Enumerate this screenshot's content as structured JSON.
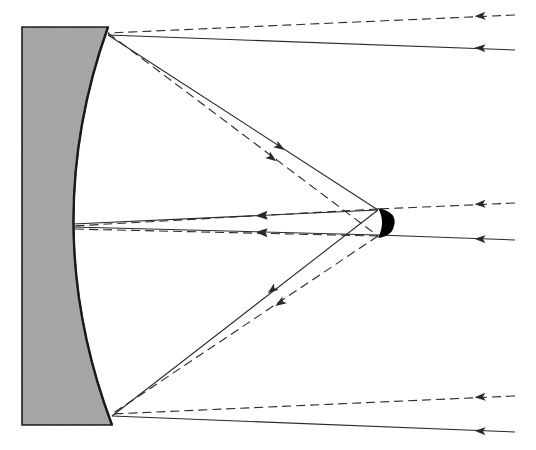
{
  "diagram": {
    "colors": {
      "mirror_fill": "#a9a9a9",
      "mirror_edge": "#1a1a1a",
      "ray": "#2a2a2a",
      "secondary": "#000000",
      "background": "#ffffff"
    },
    "primary_mirror": {
      "outer_top_left": [
        22,
        27
      ],
      "outer_bottom_left": [
        22,
        425
      ],
      "top_tip": [
        108,
        27
      ],
      "bottom_tip": [
        112,
        425
      ],
      "vertex": [
        73,
        226
      ]
    },
    "secondary_mirror": {
      "center": [
        384,
        222
      ],
      "label": "convex secondary mirror"
    },
    "rays": [
      {
        "id": "top-solid-incoming",
        "style": "solid",
        "from": [
          515,
          50
        ],
        "to": [
          108,
          35
        ],
        "arrow_at": [
          480,
          48
        ]
      },
      {
        "id": "top-dashed-incoming",
        "style": "dashed",
        "from": [
          515,
          15
        ],
        "to": [
          108,
          33
        ],
        "arrow_at": [
          480,
          16
        ]
      },
      {
        "id": "top-solid-reflected",
        "style": "solid",
        "from": [
          108,
          35
        ],
        "to": [
          378,
          210
        ],
        "arrow_at": [
          280,
          147
        ]
      },
      {
        "id": "top-dashed-reflected",
        "style": "dashed",
        "from": [
          108,
          33
        ],
        "to": [
          378,
          236
        ],
        "arrow_at": [
          272,
          158
        ]
      },
      {
        "id": "mid-solid-incoming",
        "style": "solid",
        "from": [
          515,
          240
        ],
        "to": [
          378,
          235
        ],
        "arrow_at": [
          480,
          239
        ]
      },
      {
        "id": "mid-dashed-incoming",
        "style": "dashed",
        "from": [
          515,
          203
        ],
        "to": [
          378,
          209
        ],
        "arrow_at": [
          480,
          204
        ]
      },
      {
        "id": "bot-solid-incoming",
        "style": "solid",
        "from": [
          515,
          432
        ],
        "to": [
          112,
          416
        ],
        "arrow_at": [
          480,
          431
        ]
      },
      {
        "id": "bot-dashed-incoming",
        "style": "dashed",
        "from": [
          515,
          396
        ],
        "to": [
          112,
          414
        ],
        "arrow_at": [
          480,
          397
        ]
      },
      {
        "id": "bot-solid-reflected",
        "style": "solid",
        "from": [
          378,
          210
        ],
        "to": [
          112,
          416
        ],
        "arrow_at": [
          272,
          290
        ]
      },
      {
        "id": "bot-dashed-reflected",
        "style": "dashed",
        "from": [
          378,
          236
        ],
        "to": [
          112,
          414
        ],
        "arrow_at": [
          280,
          303
        ]
      },
      {
        "id": "center-solid-return",
        "style": "solid",
        "from": [
          378,
          210
        ],
        "to": [
          73,
          224
        ],
        "arrow_at": [
          262,
          215
        ]
      },
      {
        "id": "center-dashed-return",
        "style": "dashed",
        "from": [
          378,
          209
        ],
        "to": [
          73,
          226
        ],
        "arrow_at": [
          262,
          216
        ]
      },
      {
        "id": "center-solid-return-2",
        "style": "solid",
        "from": [
          378,
          235
        ],
        "to": [
          73,
          227
        ],
        "arrow_at": [
          262,
          232
        ]
      },
      {
        "id": "center-dashed-return-2",
        "style": "dashed",
        "from": [
          378,
          236
        ],
        "to": [
          73,
          229
        ],
        "arrow_at": [
          262,
          233
        ]
      }
    ]
  }
}
